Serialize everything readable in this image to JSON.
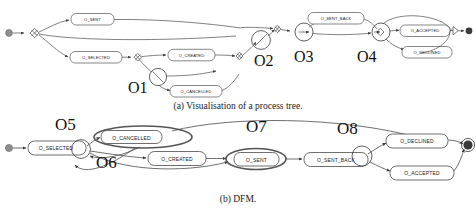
{
  "figure": {
    "captions": {
      "a": "(a) Visualisation of a process tree.",
      "b": "(b) DFM."
    }
  },
  "process_tree": {
    "id": "figure-a",
    "activities": [
      {
        "key": "o_sent",
        "label": "O_SENT"
      },
      {
        "key": "o_selected",
        "label": "O_SELECTED"
      },
      {
        "key": "o_created",
        "label": "O_CREATED"
      },
      {
        "key": "o_cancelled",
        "label": "O_CANCELLED"
      },
      {
        "key": "o_sent_back",
        "label": "O_SENT_BACK"
      },
      {
        "key": "o_accepted",
        "label": "O_ACCEPTED"
      },
      {
        "key": "o_declined",
        "label": "O_DECLINED"
      }
    ],
    "annotations": [
      {
        "key": "o1",
        "label": "O1"
      },
      {
        "key": "o2",
        "label": "O2"
      },
      {
        "key": "o3",
        "label": "O3"
      },
      {
        "key": "o4",
        "label": "O4"
      }
    ]
  },
  "dfm": {
    "id": "figure-b",
    "activities": [
      {
        "key": "o_selected",
        "label": "O_SELECTED"
      },
      {
        "key": "o_cancelled",
        "label": "O_CANCELLED"
      },
      {
        "key": "o_created",
        "label": "O_CREATED"
      },
      {
        "key": "o_sent",
        "label": "O_SENT"
      },
      {
        "key": "o_sent_back",
        "label": "O_SENT_BACK"
      },
      {
        "key": "o_declined",
        "label": "O_DECLINED"
      },
      {
        "key": "o_accepted",
        "label": "O_ACCEPTED"
      }
    ],
    "annotations": [
      {
        "key": "o5",
        "label": "O5"
      },
      {
        "key": "o6",
        "label": "O6"
      },
      {
        "key": "o7",
        "label": "O7"
      },
      {
        "key": "o8",
        "label": "O8"
      }
    ]
  },
  "colors": {
    "stroke": "#4a4a4a",
    "node_fill": "#ffffff",
    "start_dot": "#8e8e8e",
    "end_dot": "#3a3a3a",
    "text": "#1a1a1a"
  }
}
